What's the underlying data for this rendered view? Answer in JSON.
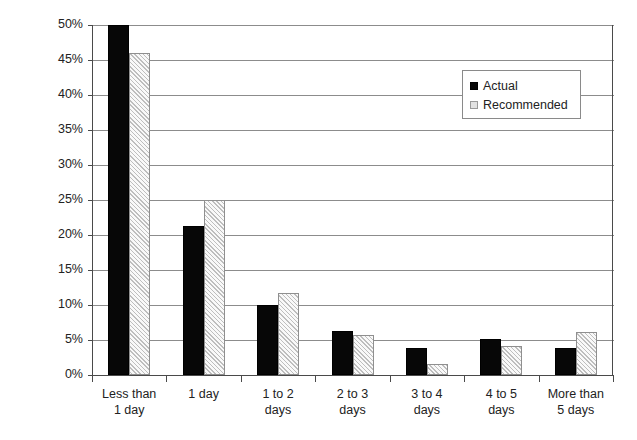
{
  "chart_data": {
    "type": "bar",
    "title": "",
    "xlabel": "",
    "ylabel": "Percent of respondents",
    "ylim": [
      0,
      50
    ],
    "ytick_labels": [
      "0%",
      "5%",
      "10%",
      "15%",
      "20%",
      "25%",
      "30%",
      "35%",
      "40%",
      "45%",
      "50%"
    ],
    "ytick_values": [
      0,
      5,
      10,
      15,
      20,
      25,
      30,
      35,
      40,
      45,
      50
    ],
    "grid": true,
    "legend_position": "upper right",
    "categories": [
      "Less than 1 day",
      "1 day",
      "1 to 2 days",
      "2 to 3 days",
      "3 to 4 days",
      "4 to 5 days",
      "More than 5 days"
    ],
    "category_lines": [
      [
        "Less than",
        "1 day"
      ],
      [
        "1 day",
        ""
      ],
      [
        "1 to 2",
        "days"
      ],
      [
        "2 to 3",
        "days"
      ],
      [
        "3 to 4",
        "days"
      ],
      [
        "4 to 5",
        "days"
      ],
      [
        "More than",
        "5 days"
      ]
    ],
    "series": [
      {
        "name": "Actual",
        "color": "#070707",
        "values": [
          50.0,
          21.3,
          10.0,
          6.3,
          3.8,
          5.1,
          3.8
        ]
      },
      {
        "name": "Recommended",
        "color": "#d6d6d6",
        "values": [
          46.0,
          25.0,
          11.7,
          5.7,
          1.6,
          4.1,
          6.1
        ]
      }
    ]
  },
  "legend": {
    "items": [
      {
        "label": "Actual",
        "swatch": "filled-black-square"
      },
      {
        "label": "Recommended",
        "swatch": "hatched-gray-square"
      }
    ]
  }
}
